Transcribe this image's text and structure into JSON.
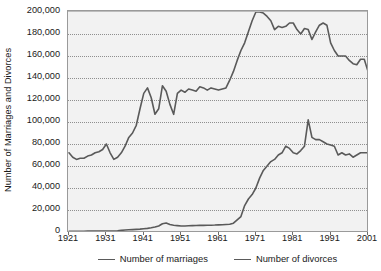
{
  "chart_data": {
    "type": "line",
    "title": "",
    "xlabel": "",
    "ylabel": "Number of Marriages and Divorces",
    "xlim": [
      1921,
      2001
    ],
    "ylim": [
      0,
      200000
    ],
    "grid": true,
    "legend_position": "bottom-center",
    "x_tick_labels": [
      "1921",
      "1931",
      "1941",
      "1951",
      "1961",
      "1971",
      "1981",
      "1991",
      "2001"
    ],
    "x_ticks": [
      1921,
      1931,
      1941,
      1951,
      1961,
      1971,
      1981,
      1991,
      2001
    ],
    "y_tick_labels": [
      "0",
      "20,000",
      "40,000",
      "60,000",
      "80,000",
      "100,000",
      "120,000",
      "140,000",
      "160,000",
      "180,000",
      "200,000"
    ],
    "y_ticks": [
      0,
      20000,
      40000,
      60000,
      80000,
      100000,
      120000,
      140000,
      160000,
      180000,
      200000
    ],
    "line_color": "#5a5a5a",
    "plot_background": "#f2f2f2",
    "gridline_color": "#8f8f8f",
    "series": [
      {
        "name": "Number of marriages",
        "x": [
          1921,
          1922,
          1923,
          1924,
          1925,
          1926,
          1927,
          1928,
          1929,
          1930,
          1931,
          1932,
          1933,
          1934,
          1935,
          1936,
          1937,
          1938,
          1939,
          1940,
          1941,
          1942,
          1943,
          1944,
          1945,
          1946,
          1947,
          1948,
          1949,
          1950,
          1951,
          1952,
          1953,
          1954,
          1955,
          1956,
          1957,
          1958,
          1959,
          1960,
          1961,
          1962,
          1963,
          1964,
          1965,
          1966,
          1967,
          1968,
          1969,
          1970,
          1971,
          1972,
          1973,
          1974,
          1975,
          1976,
          1977,
          1978,
          1979,
          1980,
          1981,
          1982,
          1983,
          1984,
          1985,
          1986,
          1987,
          1988,
          1989,
          1990,
          1991,
          1992,
          1993,
          1994,
          1995,
          1996,
          1997,
          1998,
          1999,
          2000,
          2001
        ],
        "y": [
          72000,
          68000,
          66000,
          67000,
          67000,
          69000,
          70000,
          72000,
          73000,
          75000,
          80000,
          72000,
          66000,
          68000,
          72000,
          78000,
          86000,
          90000,
          97000,
          112000,
          126000,
          131000,
          122000,
          107000,
          112000,
          133000,
          128000,
          116000,
          107000,
          126000,
          129000,
          127000,
          130000,
          129000,
          128000,
          132000,
          131000,
          129000,
          131000,
          130000,
          129000,
          130000,
          131000,
          138000,
          146000,
          156000,
          165000,
          172000,
          182000,
          192000,
          200000,
          200000,
          199000,
          196000,
          192000,
          184000,
          187000,
          186000,
          187000,
          190000,
          190000,
          184000,
          180000,
          185000,
          184000,
          175000,
          182000,
          188000,
          190000,
          188000,
          172000,
          165000,
          160000,
          160000,
          160000,
          156000,
          153000,
          152000,
          157000,
          157000,
          146000
        ]
      },
      {
        "name": "Number of divorces",
        "x": [
          1921,
          1922,
          1923,
          1924,
          1925,
          1926,
          1927,
          1928,
          1929,
          1930,
          1931,
          1932,
          1933,
          1934,
          1935,
          1936,
          1937,
          1938,
          1939,
          1940,
          1941,
          1942,
          1943,
          1944,
          1945,
          1946,
          1947,
          1948,
          1949,
          1950,
          1951,
          1952,
          1953,
          1954,
          1955,
          1956,
          1957,
          1958,
          1959,
          1960,
          1961,
          1962,
          1963,
          1964,
          1965,
          1966,
          1967,
          1968,
          1969,
          1970,
          1971,
          1972,
          1973,
          1974,
          1975,
          1976,
          1977,
          1978,
          1979,
          1980,
          1981,
          1982,
          1983,
          1984,
          1985,
          1986,
          1987,
          1988,
          1989,
          1990,
          1991,
          1992,
          1993,
          1994,
          1995,
          1996,
          1997,
          1998,
          1999,
          2000,
          2001
        ],
        "y": [
          600,
          600,
          700,
          700,
          700,
          800,
          800,
          800,
          800,
          900,
          900,
          900,
          900,
          1000,
          1500,
          1800,
          2000,
          2200,
          2400,
          2600,
          3000,
          3300,
          3800,
          4500,
          5500,
          7500,
          8200,
          6800,
          6100,
          5800,
          5500,
          5500,
          5700,
          5800,
          5900,
          6000,
          6000,
          6100,
          6200,
          6300,
          6500,
          6600,
          6800,
          7000,
          8000,
          11000,
          14000,
          24000,
          30000,
          34000,
          40000,
          49000,
          56000,
          60000,
          64000,
          66000,
          70000,
          72000,
          78000,
          76000,
          72000,
          71000,
          74000,
          78000,
          102000,
          86000,
          84000,
          84000,
          82000,
          80000,
          79000,
          78000,
          70000,
          72000,
          70000,
          71000,
          68000,
          70000,
          72000,
          72000,
          72000
        ]
      }
    ]
  },
  "legend": {
    "entries": [
      {
        "label": "Number of marriages",
        "swatch": "line-swatch-marriages"
      },
      {
        "label": "Number of divorces",
        "swatch": "line-swatch-divorces"
      }
    ]
  }
}
